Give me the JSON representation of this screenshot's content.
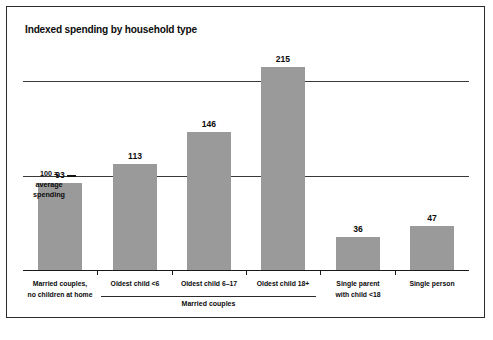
{
  "chart_data": {
    "type": "bar",
    "title": "Indexed spending by household type",
    "xlabel": "",
    "ylabel": "",
    "ylim": [
      0,
      240
    ],
    "grid": true,
    "gridlines": [
      100,
      200
    ],
    "legend": "none",
    "categories": [
      "Married couples, no children at home",
      "Oldest child <6",
      "Oldest child 6–17",
      "Oldest child 18+",
      "Single parent with child <18",
      "Single person"
    ],
    "values": [
      93,
      113,
      146,
      215,
      36,
      47
    ],
    "annotations": {
      "baseline_note": "100 = average spending",
      "group_bracket": "Married couples"
    },
    "colors": {
      "bar": "#9a9a9a",
      "axis": "#1a1a1a",
      "grid": "#3a3a3a",
      "text": "#0b0b0b",
      "background": "#ffffff",
      "border": "#2b2b2b"
    }
  },
  "chart": {
    "title": "Indexed spending by household type",
    "note": {
      "line1": "100 =",
      "line2": "average",
      "line3": "spending"
    },
    "bracket_label": "Married couples",
    "bars": [
      {
        "value_label": "93",
        "cat_line1": "Married couples,",
        "cat_line2": "no children at home"
      },
      {
        "value_label": "113",
        "cat_line1": "Oldest child <6",
        "cat_line2": ""
      },
      {
        "value_label": "146",
        "cat_line1": "Oldest child 6–17",
        "cat_line2": ""
      },
      {
        "value_label": "215",
        "cat_line1": "Oldest child 18+",
        "cat_line2": ""
      },
      {
        "value_label": "36",
        "cat_line1": "Single parent",
        "cat_line2": "with child <18"
      },
      {
        "value_label": "47",
        "cat_line1": "Single person",
        "cat_line2": ""
      }
    ]
  }
}
